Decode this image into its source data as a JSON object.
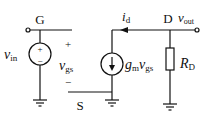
{
  "diagram": {
    "nodes": {
      "gate": "G",
      "source": "S",
      "drain": "D"
    },
    "labels": {
      "vin_main": "v",
      "vin_sub": "in",
      "vgs_main": "v",
      "vgs_sub": "gs",
      "vgs_plus": "+",
      "vgs_minus": "−",
      "src_plus": "+",
      "src_minus": "−",
      "id_main": "i",
      "id_sub": "d",
      "vout_main": "v",
      "vout_sub": "out",
      "gm_main": "g",
      "gm_sub": "m",
      "gm_v": "v",
      "gm_vsub": "gs",
      "rd_main": "R",
      "rd_sub": "D"
    },
    "components": [
      {
        "type": "voltage-source",
        "name": "v_in"
      },
      {
        "type": "dependent-current-source",
        "name": "g_m v_gs"
      },
      {
        "type": "resistor",
        "name": "R_D"
      },
      {
        "type": "ground",
        "count": 3
      }
    ],
    "colors": {
      "stroke": "#111111",
      "background": "#ffffff"
    }
  }
}
